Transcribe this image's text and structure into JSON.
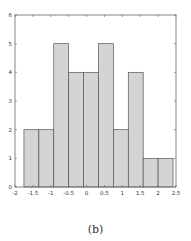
{
  "caption": "(b)",
  "colors": {
    "bar_fill": "#d4d4d4",
    "bar_edge": "#555555",
    "axis": "#666666",
    "background": "#ffffff"
  },
  "chart_data": {
    "type": "bar",
    "subtype": "histogram",
    "title": "",
    "xlabel": "",
    "ylabel": "",
    "xlim": [
      -2,
      2.5
    ],
    "ylim": [
      0,
      6
    ],
    "grid": false,
    "legend": null,
    "x_ticks": [
      -2,
      -1.5,
      -1,
      -0.5,
      0,
      0.5,
      1,
      1.5,
      2,
      2.5
    ],
    "x_tick_labels": [
      "-2",
      "-1.5",
      "-1",
      "-0.5",
      "0",
      "0.5",
      "1",
      "1.5",
      "2",
      "2.5"
    ],
    "y_ticks": [
      0,
      1,
      2,
      3,
      4,
      5,
      6
    ],
    "y_tick_labels": [
      "0",
      "1",
      "2",
      "3",
      "4",
      "5",
      "6"
    ],
    "bin_edges": [
      -1.75,
      -1.333,
      -0.917,
      -0.5,
      -0.083,
      0.333,
      0.75,
      1.167,
      1.583,
      2.0,
      2.417
    ],
    "values": [
      2,
      2,
      5,
      4,
      4,
      5,
      2,
      4,
      1,
      1
    ]
  }
}
